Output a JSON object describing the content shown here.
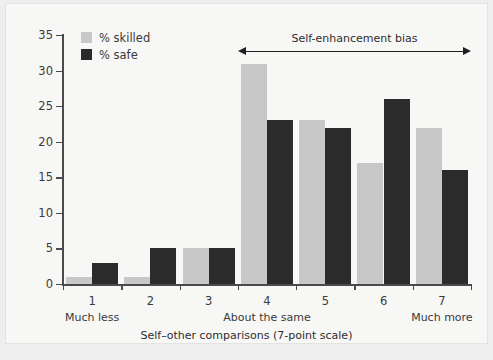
{
  "chart_data": {
    "type": "bar",
    "title": "",
    "xlabel": "Self–other comparisons (7-point scale)",
    "ylabel": "",
    "ylim": [
      0,
      35
    ],
    "yticks": [
      0,
      5,
      10,
      15,
      20,
      25,
      30,
      35
    ],
    "grid": false,
    "legend_position": "top-left",
    "categories": [
      "1",
      "2",
      "3",
      "4",
      "5",
      "6",
      "7"
    ],
    "category_sublabels": [
      "Much less",
      "",
      "",
      "About the same",
      "",
      "",
      "Much more"
    ],
    "series": [
      {
        "name": "% skilled",
        "color": "#c8c8c8",
        "values": [
          1,
          1,
          5,
          31,
          23,
          17,
          22
        ]
      },
      {
        "name": "% safe",
        "color": "#2b2b2b",
        "values": [
          3,
          5,
          5,
          23,
          22,
          26,
          16
        ]
      }
    ],
    "annotations": [
      {
        "text": "Self-enhancement bias",
        "type": "double-arrow",
        "from_category": "4",
        "to_category": "7"
      }
    ]
  },
  "legend": {
    "items": [
      {
        "label": "% skilled",
        "color": "#c8c8c8"
      },
      {
        "label": "% safe",
        "color": "#2b2b2b"
      }
    ]
  },
  "colors": {
    "skilled": "#c8c8c8",
    "safe": "#2b2b2b",
    "axis": "#4a4a4a",
    "text": "#3a3a3a",
    "panel_background": "#f7f7f6",
    "figure_background": "#eeeeee"
  }
}
